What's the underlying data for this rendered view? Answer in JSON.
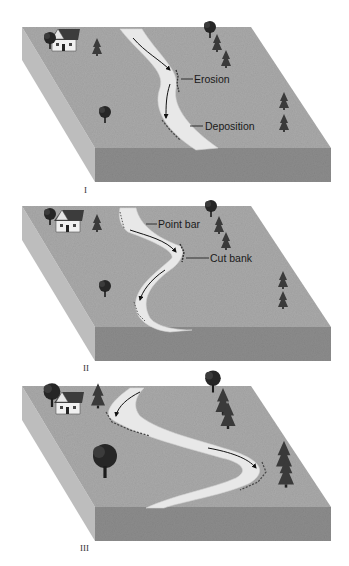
{
  "figure": {
    "panels": [
      {
        "id": "I",
        "roman_label": "I",
        "annotations": [
          {
            "text": "Erosion"
          },
          {
            "text": "Deposition"
          }
        ]
      },
      {
        "id": "II",
        "roman_label": "II",
        "annotations": [
          {
            "text": "Point bar"
          },
          {
            "text": "Cut bank"
          }
        ]
      },
      {
        "id": "III",
        "roman_label": "III",
        "annotations": []
      }
    ]
  },
  "colors": {
    "ground_top": "#a9a9a9",
    "ground_side_left": "#bdbdbd",
    "ground_front": "#8c8c8c",
    "river": "#e8e8e8",
    "river_edge": "#d4d4d4",
    "tree": "#2b2b2b",
    "house_wall": "#f2f2f2",
    "house_roof": "#3a3a3a",
    "arrow": "#111111"
  }
}
